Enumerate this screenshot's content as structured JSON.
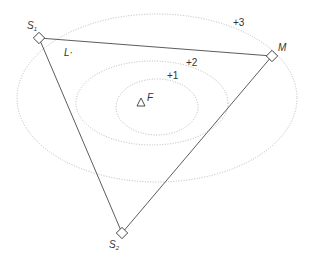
{
  "diagram": {
    "contours": [
      {
        "label": "+1",
        "cx": 157,
        "cy": 107,
        "rx": 41,
        "ry": 28,
        "label_x": 168,
        "label_y": 79
      },
      {
        "label": "+2",
        "cx": 152,
        "cy": 103,
        "rx": 76,
        "ry": 42,
        "label_x": 186,
        "label_y": 66
      },
      {
        "label": "+3",
        "cx": 157,
        "cy": 98,
        "rx": 140,
        "ry": 84,
        "label_x": 233,
        "label_y": 26
      }
    ],
    "focus": {
      "label": "F",
      "x": 141,
      "y": 103
    },
    "vertices": {
      "S1": {
        "label": "S",
        "subscript": "1",
        "x": 39,
        "y": 38
      },
      "M": {
        "label": "M",
        "x": 272,
        "y": 56
      },
      "S2": {
        "label": "S",
        "subscript": "2",
        "x": 122,
        "y": 233
      }
    },
    "edge_label": "L·",
    "colors": {
      "contour": "#b8b8b8",
      "edge": "#4a4a4a",
      "text": "#333333"
    }
  }
}
